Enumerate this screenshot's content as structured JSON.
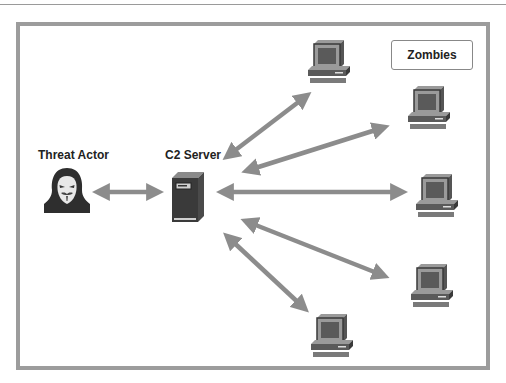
{
  "diagram": {
    "labels": {
      "threat_actor": "Threat Actor",
      "c2_server": "C2 Server",
      "zombies": "Zombies"
    },
    "colors": {
      "arrow": "#8c8c8c",
      "frame": "#9c9c9c",
      "icon_dark": "#3a3a3a",
      "icon_mid": "#6e6e6e",
      "icon_light": "#a8a8a8"
    },
    "nodes": [
      {
        "id": "threat-actor",
        "type": "hacker-icon"
      },
      {
        "id": "c2-server",
        "type": "server-icon"
      },
      {
        "id": "zombie-1",
        "type": "computer-icon"
      },
      {
        "id": "zombie-2",
        "type": "computer-icon"
      },
      {
        "id": "zombie-3",
        "type": "computer-icon"
      },
      {
        "id": "zombie-4",
        "type": "computer-icon"
      },
      {
        "id": "zombie-5",
        "type": "computer-icon"
      }
    ],
    "edges": [
      {
        "from": "threat-actor",
        "to": "c2-server",
        "bidirectional": true
      },
      {
        "from": "c2-server",
        "to": "zombie-1",
        "bidirectional": true
      },
      {
        "from": "c2-server",
        "to": "zombie-2",
        "bidirectional": true
      },
      {
        "from": "c2-server",
        "to": "zombie-3",
        "bidirectional": true
      },
      {
        "from": "c2-server",
        "to": "zombie-4",
        "bidirectional": true
      },
      {
        "from": "c2-server",
        "to": "zombie-5",
        "bidirectional": true
      }
    ]
  }
}
